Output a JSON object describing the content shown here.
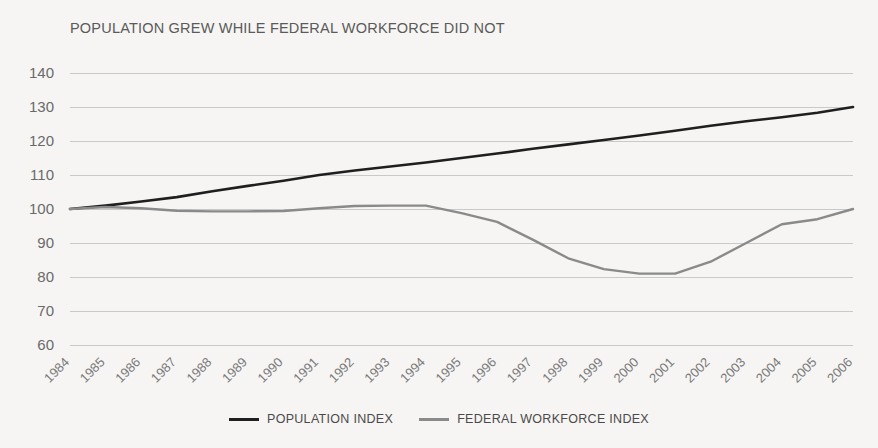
{
  "chart_data": {
    "type": "line",
    "title": "POPULATION GREW WHILE FEDERAL WORKFORCE DID NOT",
    "xlabel": "",
    "ylabel": "",
    "ylim": [
      60,
      140
    ],
    "yticks": [
      140,
      130,
      120,
      110,
      100,
      90,
      80,
      70,
      60
    ],
    "grid": true,
    "legend_position": "bottom-center",
    "x": [
      1984,
      1985,
      1986,
      1987,
      1988,
      1989,
      1990,
      1991,
      1992,
      1993,
      1994,
      1995,
      1996,
      1997,
      1998,
      1999,
      2000,
      2001,
      2002,
      2003,
      2004,
      2005,
      2006
    ],
    "categories": [
      "1984",
      "1985",
      "1986",
      "1987",
      "1988",
      "1989",
      "1990",
      "1991",
      "1992",
      "1993",
      "1994",
      "1995",
      "1996",
      "1997",
      "1998",
      "1999",
      "2000",
      "2001",
      "2002",
      "2003",
      "2004",
      "2005",
      "2006"
    ],
    "series": [
      {
        "name": "POPULATION INDEX",
        "color": "#1f1f1f",
        "values": [
          100.0,
          101.0,
          102.2,
          103.5,
          105.2,
          106.8,
          108.3,
          110.0,
          111.3,
          112.5,
          113.7,
          115.0,
          116.3,
          117.7,
          119.0,
          120.3,
          121.6,
          123.0,
          124.5,
          125.8,
          127.0,
          128.3,
          130.0
        ]
      },
      {
        "name": "FEDERAL WORKFORCE INDEX",
        "color": "#8a8a8a",
        "values": [
          100.0,
          100.6,
          100.2,
          99.5,
          99.3,
          99.3,
          99.4,
          100.2,
          100.9,
          101.0,
          101.0,
          98.8,
          96.2,
          91.0,
          85.5,
          82.3,
          81.0,
          81.0,
          84.5,
          90.0,
          95.5,
          97.0,
          97.0
        ]
      }
    ],
    "series_note_last_point": {
      "FEDERAL WORKFORCE INDEX": 100.0
    }
  },
  "legend": {
    "items": [
      {
        "label": "POPULATION INDEX",
        "color": "#1f1f1f"
      },
      {
        "label": "FEDERAL WORKFORCE INDEX",
        "color": "#8a8a8a"
      }
    ]
  },
  "style": {
    "background": "#f6f5f3",
    "gridline_color": "#c9c9c9",
    "text_color": "#6a6a6a"
  }
}
